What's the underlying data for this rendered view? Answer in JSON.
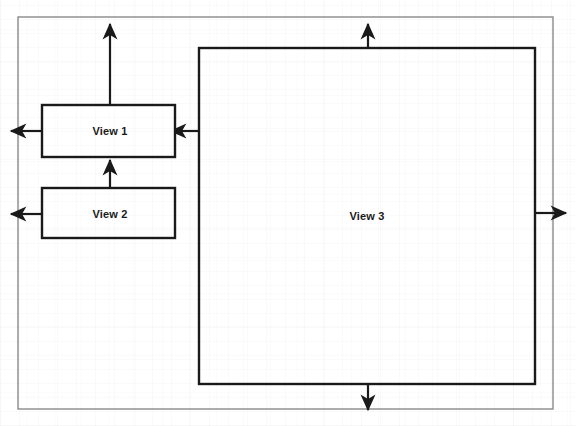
{
  "diagram": {
    "type": "block-diagram",
    "title": "",
    "background_color": "#ffffff",
    "stroke_color": "#1a1a1a",
    "boundary_color": "#8a8a8a",
    "boundary": {
      "name": "system-boundary",
      "x": 18,
      "y": 17,
      "width": 535,
      "height": 392
    },
    "nodes": [
      {
        "id": "view1",
        "label": "View 1",
        "x": 42,
        "y": 105,
        "width": 133,
        "height": 52,
        "label_x": 110,
        "label_y": 131
      },
      {
        "id": "view2",
        "label": "View 2",
        "x": 42,
        "y": 188,
        "width": 133,
        "height": 50,
        "label_x": 110,
        "label_y": 214
      },
      {
        "id": "view3",
        "label": "View 3",
        "x": 199,
        "y": 48,
        "width": 336,
        "height": 336,
        "label_x": 367,
        "label_y": 216
      }
    ],
    "arrows": [
      {
        "id": "view1-out-top",
        "from": "view1",
        "to": "outside-top",
        "direction": "up",
        "x1": 110,
        "y1": 105,
        "x2": 110,
        "y2": 24
      },
      {
        "id": "view1-out-left",
        "from": "view1",
        "to": "outside-left",
        "direction": "left",
        "x1": 42,
        "y1": 131,
        "x2": 11,
        "y2": 131
      },
      {
        "id": "view2-out-left",
        "from": "view2",
        "to": "outside-left",
        "direction": "left",
        "x1": 42,
        "y1": 214,
        "x2": 11,
        "y2": 214
      },
      {
        "id": "view2-to-view1",
        "from": "view2",
        "to": "view1",
        "direction": "up",
        "x1": 110,
        "y1": 188,
        "x2": 110,
        "y2": 160
      },
      {
        "id": "view3-to-view1",
        "from": "view3",
        "to": "view1",
        "direction": "left",
        "x1": 199,
        "y1": 131,
        "x2": 171,
        "y2": 131
      },
      {
        "id": "view3-out-top",
        "from": "view3",
        "to": "outside-top",
        "direction": "up",
        "x1": 368,
        "y1": 48,
        "x2": 368,
        "y2": 24
      },
      {
        "id": "view3-out-right",
        "from": "view3",
        "to": "outside-right",
        "direction": "right",
        "x1": 535,
        "y1": 213,
        "x2": 566,
        "y2": 213
      },
      {
        "id": "view3-out-bottom",
        "from": "view3",
        "to": "outside-bottom",
        "direction": "down",
        "x1": 368,
        "y1": 384,
        "x2": 368,
        "y2": 410
      }
    ]
  }
}
